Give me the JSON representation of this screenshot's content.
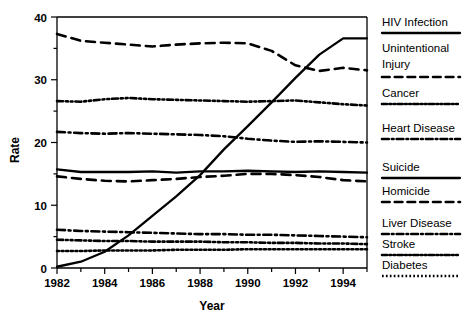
{
  "chart_data": {
    "type": "line",
    "title": "",
    "xlabel": "Year",
    "ylabel": "Rate",
    "xlim": [
      1982,
      1995
    ],
    "ylim": [
      0,
      40
    ],
    "xticks": [
      1982,
      1984,
      1986,
      1988,
      1990,
      1992,
      1994
    ],
    "xtick_labels": [
      "1982",
      "1984",
      "1986",
      "1988",
      "1990",
      "1992",
      "1994"
    ],
    "xminor_ticks": [
      1983,
      1985,
      1987,
      1989,
      1991,
      1993,
      1995
    ],
    "yticks": [
      0,
      10,
      20,
      30,
      40
    ],
    "ytick_labels": [
      "0",
      "10",
      "20",
      "30",
      "40"
    ],
    "yminor_ticks": [
      5,
      15,
      25,
      35
    ],
    "grid": false,
    "legend_position": "right",
    "x": [
      1982,
      1983,
      1984,
      1985,
      1986,
      1987,
      1988,
      1989,
      1990,
      1991,
      1992,
      1993,
      1994,
      1995
    ],
    "series": [
      {
        "name": "HIV Infection",
        "style": "solid",
        "values": [
          0.2,
          1.0,
          2.6,
          5.2,
          8.3,
          11.4,
          14.8,
          18.9,
          22.6,
          26.4,
          30.3,
          34.0,
          36.6,
          36.6
        ]
      },
      {
        "name": "Unintentional Injury",
        "style": "dashed",
        "values": [
          37.3,
          36.2,
          35.9,
          35.6,
          35.3,
          35.6,
          35.8,
          35.9,
          35.8,
          34.6,
          32.3,
          31.4,
          31.9,
          31.5
        ]
      },
      {
        "name": "Cancer",
        "style": "dash-dot-dot",
        "values": [
          26.6,
          26.5,
          26.9,
          27.1,
          26.9,
          26.8,
          26.7,
          26.6,
          26.5,
          26.6,
          26.7,
          26.4,
          26.1,
          25.9
        ]
      },
      {
        "name": "Heart Disease",
        "style": "dash-dot",
        "values": [
          21.7,
          21.5,
          21.4,
          21.5,
          21.4,
          21.3,
          21.2,
          21.0,
          20.6,
          20.3,
          20.1,
          20.2,
          20.1,
          20.0
        ]
      },
      {
        "name": "Suicide",
        "style": "solid",
        "values": [
          15.7,
          15.3,
          15.3,
          15.3,
          15.4,
          15.2,
          15.4,
          15.4,
          15.5,
          15.4,
          15.3,
          15.4,
          15.3,
          15.2
        ]
      },
      {
        "name": "Homicide",
        "style": "dashed",
        "values": [
          14.6,
          14.2,
          13.9,
          13.8,
          14.0,
          14.2,
          14.5,
          14.7,
          15.0,
          15.0,
          14.8,
          14.5,
          14.0,
          13.8
        ]
      },
      {
        "name": "Liver Disease",
        "style": "dash-dot",
        "values": [
          6.1,
          5.9,
          5.8,
          5.7,
          5.6,
          5.5,
          5.4,
          5.4,
          5.3,
          5.3,
          5.2,
          5.1,
          5.0,
          4.9
        ]
      },
      {
        "name": "Stroke",
        "style": "dash-dot-dot",
        "values": [
          4.5,
          4.4,
          4.3,
          4.3,
          4.2,
          4.2,
          4.2,
          4.1,
          4.1,
          4.0,
          4.0,
          3.9,
          3.9,
          3.8
        ]
      },
      {
        "name": "Diabetes",
        "style": "dotted",
        "values": [
          2.7,
          2.7,
          2.8,
          2.8,
          2.8,
          2.9,
          2.9,
          2.9,
          3.0,
          3.0,
          3.0,
          3.0,
          3.0,
          3.0
        ]
      }
    ]
  },
  "legend": {
    "items": [
      {
        "label": "HIV Infection",
        "style": "solid"
      },
      {
        "label": "Unintentional",
        "label2": "Injury",
        "style": "dashed"
      },
      {
        "label": "Cancer",
        "style": "dash-dot-dot"
      },
      {
        "label": "Heart Disease",
        "style": "dash-dot"
      },
      {
        "label": "Suicide",
        "style": "solid"
      },
      {
        "label": "Homicide",
        "style": "dashed"
      },
      {
        "label": "Liver Disease",
        "style": "dash-dot"
      },
      {
        "label": "Stroke",
        "style": "dash-dot-dot"
      },
      {
        "label": "Diabetes",
        "style": "dotted"
      }
    ]
  },
  "colors": {
    "ink": "#000000",
    "background": "#ffffff"
  }
}
